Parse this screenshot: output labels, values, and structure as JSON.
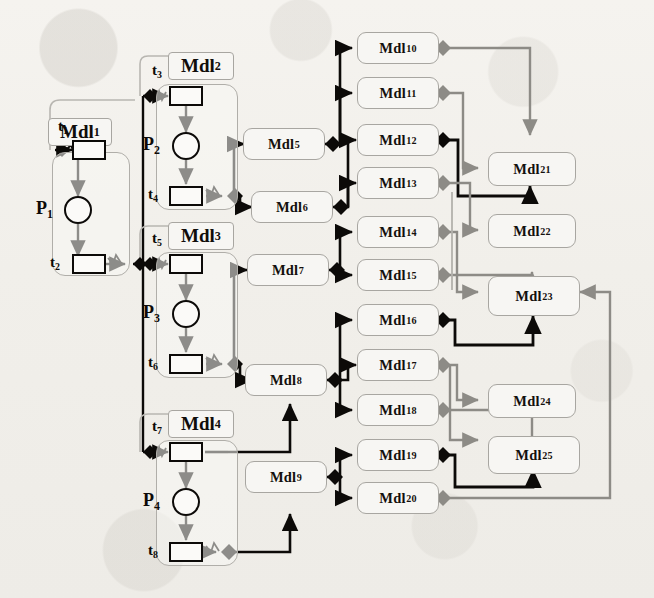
{
  "figure": {
    "colors": {
      "background": "#f2f0ec",
      "node_fill": "#f7f6f3",
      "node_border": "#a8a6a1",
      "black_wire": "#0c0a08",
      "gray_wire": "#8d8b86",
      "text": "#14100d"
    }
  },
  "modules": {
    "petri": [
      {
        "id": "mdl1",
        "label": "Mdl",
        "sub": "1",
        "place": "P",
        "place_sub": "1",
        "t_in": "t",
        "t_in_sub": "1",
        "t_out": "t",
        "t_out_sub": "2"
      },
      {
        "id": "mdl2",
        "label": "Mdl",
        "sub": "2",
        "place": "P",
        "place_sub": "2",
        "t_in": "t",
        "t_in_sub": "3",
        "t_out": "t",
        "t_out_sub": "4"
      },
      {
        "id": "mdl3",
        "label": "Mdl",
        "sub": "3",
        "place": "P",
        "place_sub": "3",
        "t_in": "t",
        "t_in_sub": "5",
        "t_out": "t",
        "t_out_sub": "6"
      },
      {
        "id": "mdl4",
        "label": "Mdl",
        "sub": "4",
        "place": "P",
        "place_sub": "4",
        "t_in": "t",
        "t_in_sub": "7",
        "t_out": "t",
        "t_out_sub": "8"
      }
    ],
    "mid": [
      {
        "id": "mdl5",
        "label": "Mdl",
        "sub": "5"
      },
      {
        "id": "mdl6",
        "label": "Mdl",
        "sub": "6"
      },
      {
        "id": "mdl7",
        "label": "Mdl",
        "sub": "7"
      },
      {
        "id": "mdl8",
        "label": "Mdl",
        "sub": "8"
      },
      {
        "id": "mdl9",
        "label": "Mdl",
        "sub": "9"
      }
    ],
    "column3": [
      {
        "id": "mdl10",
        "label": "Mdl",
        "sub": "10"
      },
      {
        "id": "mdl11",
        "label": "Mdl",
        "sub": "11"
      },
      {
        "id": "mdl12",
        "label": "Mdl",
        "sub": "12"
      },
      {
        "id": "mdl13",
        "label": "Mdl",
        "sub": "13"
      },
      {
        "id": "mdl14",
        "label": "Mdl",
        "sub": "14"
      },
      {
        "id": "mdl15",
        "label": "Mdl",
        "sub": "15"
      },
      {
        "id": "mdl16",
        "label": "Mdl",
        "sub": "16"
      },
      {
        "id": "mdl17",
        "label": "Mdl",
        "sub": "17"
      },
      {
        "id": "mdl18",
        "label": "Mdl",
        "sub": "18"
      },
      {
        "id": "mdl19",
        "label": "Mdl",
        "sub": "19"
      },
      {
        "id": "mdl20",
        "label": "Mdl",
        "sub": "20"
      }
    ],
    "column4": [
      {
        "id": "mdl21",
        "label": "Mdl",
        "sub": "21"
      },
      {
        "id": "mdl22",
        "label": "Mdl",
        "sub": "22"
      },
      {
        "id": "mdl23",
        "label": "Mdl",
        "sub": "23"
      },
      {
        "id": "mdl24",
        "label": "Mdl",
        "sub": "24"
      },
      {
        "id": "mdl25",
        "label": "Mdl",
        "sub": "25"
      }
    ]
  },
  "connections": [
    {
      "from": "mdl1.t2",
      "to": "mdl2.t3",
      "style": "black"
    },
    {
      "from": "mdl1.t2",
      "to": "mdl3.t5",
      "style": "black"
    },
    {
      "from": "mdl1.t2",
      "to": "mdl4.t7",
      "style": "black"
    },
    {
      "from": "mdl2.t4",
      "to": "mdl5",
      "style": "black"
    },
    {
      "from": "mdl2.t4",
      "to": "mdl6",
      "style": "black"
    },
    {
      "from": "mdl3.t6",
      "to": "mdl7",
      "style": "black"
    },
    {
      "from": "mdl3.t6",
      "to": "mdl8",
      "style": "black"
    },
    {
      "from": "mdl4.t7",
      "to": "mdl8",
      "style": "black"
    },
    {
      "from": "mdl4.t8",
      "to": "mdl9",
      "style": "black"
    },
    {
      "from": "mdl5",
      "to": "mdl10",
      "style": "black"
    },
    {
      "from": "mdl5",
      "to": "mdl11",
      "style": "black"
    },
    {
      "from": "mdl6",
      "to": "mdl12",
      "style": "black"
    },
    {
      "from": "mdl6",
      "to": "mdl13",
      "style": "black"
    },
    {
      "from": "mdl7",
      "to": "mdl14",
      "style": "black"
    },
    {
      "from": "mdl7",
      "to": "mdl15",
      "style": "black"
    },
    {
      "from": "mdl8",
      "to": "mdl16",
      "style": "black"
    },
    {
      "from": "mdl8",
      "to": "mdl17",
      "style": "black"
    },
    {
      "from": "mdl8",
      "to": "mdl18",
      "style": "black"
    },
    {
      "from": "mdl9",
      "to": "mdl19",
      "style": "black"
    },
    {
      "from": "mdl9",
      "to": "mdl20",
      "style": "black"
    },
    {
      "from": "mdl10",
      "to": "mdl21",
      "style": "gray"
    },
    {
      "from": "mdl11",
      "to": "mdl21",
      "style": "gray"
    },
    {
      "from": "mdl12",
      "to": "mdl21",
      "style": "black"
    },
    {
      "from": "mdl13",
      "to": "mdl22",
      "style": "gray"
    },
    {
      "from": "mdl14",
      "to": "mdl23",
      "style": "gray"
    },
    {
      "from": "mdl15",
      "to": "mdl23",
      "style": "gray"
    },
    {
      "from": "mdl16",
      "to": "mdl23",
      "style": "black"
    },
    {
      "from": "mdl17",
      "to": "mdl24",
      "style": "gray"
    },
    {
      "from": "mdl18",
      "to": "mdl25",
      "style": "gray"
    },
    {
      "from": "mdl19",
      "to": "mdl25",
      "style": "black"
    },
    {
      "from": "mdl20",
      "to": "mdl23",
      "style": "gray"
    }
  ]
}
